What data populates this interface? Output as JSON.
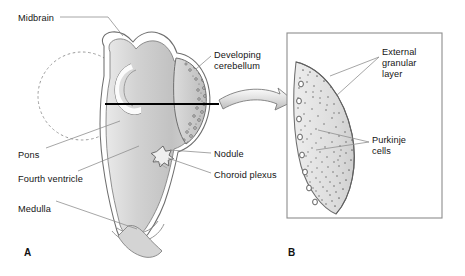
{
  "figure": {
    "background": "#ffffff",
    "width": 465,
    "height": 276
  },
  "colors": {
    "outline": "#6e6e6e",
    "outline_dark": "#4a4a4a",
    "fill_light": "#f2f2f2",
    "fill_mid": "#cfcfcf",
    "fill_dark": "#b3b3b3",
    "leader": "#8a8a8a",
    "section_line": "#000000",
    "text": "#141414",
    "box_border": "#8d8d8d",
    "stipple": "#7a7a7a"
  },
  "panels": [
    {
      "id": "A",
      "letter": "A",
      "x": 24,
      "y": 247
    },
    {
      "id": "B",
      "letter": "B",
      "x": 288,
      "y": 247
    }
  ],
  "panel_a": {
    "name": "sagittal-view-developing-brainstem",
    "labels": [
      {
        "key": "midbrain",
        "text": "Midbrain",
        "x": 18,
        "y": 13,
        "align": "left"
      },
      {
        "key": "pons",
        "text": "Pons",
        "x": 18,
        "y": 150,
        "align": "left"
      },
      {
        "key": "fourth_ventricle",
        "text": "Fourth ventricle",
        "x": 18,
        "y": 174,
        "align": "left"
      },
      {
        "key": "medulla",
        "text": "Medulla",
        "x": 18,
        "y": 204,
        "align": "left"
      },
      {
        "key": "developing_cerebellum_l1",
        "text": "Developing",
        "x": 214,
        "y": 50,
        "align": "left"
      },
      {
        "key": "developing_cerebellum_l2",
        "text": "cerebellum",
        "x": 214,
        "y": 61,
        "align": "left"
      },
      {
        "key": "nodule",
        "text": "Nodule",
        "x": 214,
        "y": 155,
        "align": "left"
      },
      {
        "key": "choroid_plexus",
        "text": "Choroid plexus",
        "x": 214,
        "y": 176,
        "align": "left"
      }
    ],
    "markers": {
      "nodule_star": "star-marker",
      "dashed_circle": "cerebral-hemisphere-outline",
      "section_line": "plane-of-section-line"
    }
  },
  "panel_b": {
    "name": "cerebellar-cortex-detail",
    "box": {
      "x": 287,
      "y": 33,
      "width": 155,
      "height": 185
    },
    "labels": [
      {
        "key": "external_granular_l1",
        "text": "External",
        "x": 382,
        "y": 52,
        "align": "left"
      },
      {
        "key": "external_granular_l2",
        "text": "granular",
        "x": 382,
        "y": 63,
        "align": "left"
      },
      {
        "key": "external_granular_l3",
        "text": "layer",
        "x": 382,
        "y": 74,
        "align": "left"
      },
      {
        "key": "purkinje_l1",
        "text": "Purkinje",
        "x": 372,
        "y": 140,
        "align": "left"
      },
      {
        "key": "purkinje_l2",
        "text": "cells",
        "x": 372,
        "y": 151,
        "align": "left"
      }
    ],
    "features": {
      "external_granular_layer": "dense-stipple-band",
      "purkinje_cells": "open-circle-column"
    }
  },
  "arrow": {
    "name": "magnification-arrow",
    "from_x": 222,
    "from_y": 96,
    "to_x": 288,
    "to_y": 112
  }
}
